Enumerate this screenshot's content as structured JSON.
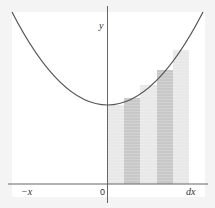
{
  "diagram": {
    "type": "riemann-sum-parabola",
    "labels": {
      "y_axis": "y",
      "neg_x": "−x",
      "origin": "0",
      "dx": "dx"
    },
    "curve": "parabola opening upward, vertex on y-axis",
    "bars": [
      {
        "shade": "light",
        "height_ratio": 0.6
      },
      {
        "shade": "dark",
        "height_ratio": 0.64
      },
      {
        "shade": "light",
        "height_ratio": 0.72
      },
      {
        "shade": "dark",
        "height_ratio": 0.82
      },
      {
        "shade": "light",
        "height_ratio": 0.93
      }
    ],
    "colors": {
      "background": "#f4f4f4",
      "frame": "#ffffff",
      "curve": "#555555",
      "axis": "#666666",
      "bar_light": "#e6e6e6",
      "bar_dark": "#c9c9c9"
    }
  }
}
